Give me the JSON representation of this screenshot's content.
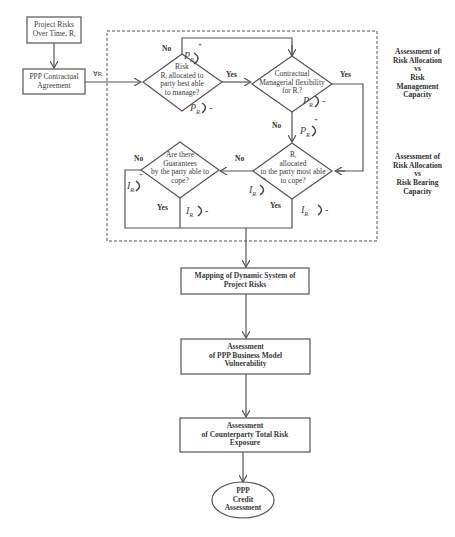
{
  "diagram": {
    "start_box": {
      "line1": "Project Risks",
      "line2": "Over Time, Rᵢ"
    },
    "contract_box": {
      "line1": "PPP Contractual",
      "line2": "Agreement"
    },
    "forall_label": "∀Rᵢ",
    "decision1": {
      "lines": [
        "Risk",
        "Rᵢ allocated to",
        "party best able",
        "to manage?"
      ]
    },
    "decision2": {
      "lines": [
        "Contractual",
        "Managerial flexibility",
        "for Rᵢ?"
      ]
    },
    "decision3": {
      "lines": [
        "Rᵢ",
        "allocated",
        "to the party most able",
        "to cope?"
      ]
    },
    "decision4": {
      "lines": [
        "Are there",
        "Guarantees",
        "by the party able to",
        "cope?"
      ]
    },
    "labels": {
      "yes": "Yes",
      "no": "No"
    },
    "symbols": {
      "p": "P",
      "i": "I",
      "sub": "Rᵢ",
      "plus": "+",
      "minus": "-"
    },
    "side_notes": [
      {
        "lines": [
          "Assessment of",
          "Risk Allocation",
          "vs",
          "Risk",
          "Management",
          "Capacity"
        ]
      },
      {
        "lines": [
          "Assessment of",
          "Risk Allocation",
          "vs",
          "Risk Bearing",
          "Capacity"
        ]
      }
    ],
    "mapping_box": {
      "lines": [
        "Mapping of  Dynamic System of",
        "Project Risks"
      ]
    },
    "business_box": {
      "lines": [
        "Assessment",
        "of PPP Business Model",
        "Vulnerability"
      ]
    },
    "counterparty_box": {
      "lines": [
        "Assessment",
        "of Counterparty Total Risk",
        "Exposure"
      ]
    },
    "end_ellipse": {
      "lines": [
        "PPP",
        "Credit",
        "Assessment"
      ]
    },
    "colors": {
      "line": "#555555",
      "text": "#3a3a3a"
    }
  }
}
